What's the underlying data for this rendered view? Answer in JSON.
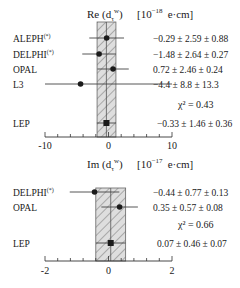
{
  "chart_data": [
    {
      "type": "scatter",
      "subtype": "forest-plot",
      "title": "Re (d_τ^w)",
      "title_parts": {
        "prefix": "Re (d",
        "sub": "τ",
        "sup": "w",
        "suffix": ")"
      },
      "unit": "[10^-18 e·cm]",
      "unit_parts": {
        "base": "[10",
        "exp": "−18",
        "tail": "e·cm]"
      },
      "xlim": [
        -10,
        10
      ],
      "xticks": [
        -10,
        0,
        10
      ],
      "xtick_labels": [
        "-10",
        "0",
        "10"
      ],
      "minor_ticks_between": 4,
      "grid": false,
      "band": {
        "center": -0.33,
        "low": -1.8,
        "high": 1.17,
        "style": "hatched"
      },
      "rows": [
        {
          "label": "ALEPH",
          "note": "(*)",
          "value": -0.29,
          "stat": 2.59,
          "syst": 0.88,
          "text": "−0.29 ± 2.59 ± 0.88",
          "marker": "circle"
        },
        {
          "label": "DELPHI",
          "note": "(*)",
          "value": -1.48,
          "stat": 2.64,
          "syst": 0.27,
          "text": "−1.48 ± 2.64 ± 0.27",
          "marker": "circle"
        },
        {
          "label": "OPAL",
          "note": "",
          "value": 0.72,
          "stat": 2.46,
          "syst": 0.24,
          "text": "0.72  ± 2.46 ± 0.24",
          "marker": "circle"
        },
        {
          "label": "L3",
          "note": "",
          "value": -4.4,
          "stat": 8.8,
          "syst": 13.3,
          "text": "−4.4  ± 8.8  ± 13.3",
          "marker": "circle"
        }
      ],
      "chi2": {
        "label": "χ² = 0.43",
        "value": 0.43
      },
      "combined": {
        "label": "LEP",
        "value": -0.33,
        "stat": 1.46,
        "syst": 0.36,
        "text": "−0.33 ± 1.46 ± 0.36",
        "marker": "square"
      }
    },
    {
      "type": "scatter",
      "subtype": "forest-plot",
      "title": "Im (d_τ^w)",
      "title_parts": {
        "prefix": "Im (d",
        "sub": "τ",
        "sup": "w",
        "suffix": ")"
      },
      "unit": "[10^-17 e·cm]",
      "unit_parts": {
        "base": "[10",
        "exp": "−17",
        "tail": "e·cm]"
      },
      "xlim": [
        -2,
        2
      ],
      "xticks": [
        -2,
        0,
        2
      ],
      "xtick_labels": [
        "-2",
        "0",
        "2"
      ],
      "minor_ticks_between": 4,
      "grid": false,
      "band": {
        "center": 0.07,
        "low": -0.4,
        "high": 0.54,
        "style": "hatched"
      },
      "rows": [
        {
          "label": "DELPHI",
          "note": "(*)",
          "value": -0.44,
          "stat": 0.77,
          "syst": 0.13,
          "text": "−0.44 ± 0.77 ± 0.13",
          "marker": "circle"
        },
        {
          "label": "OPAL",
          "note": "",
          "value": 0.35,
          "stat": 0.57,
          "syst": 0.08,
          "text": "0.35  ± 0.57 ± 0.08",
          "marker": "circle"
        }
      ],
      "chi2": {
        "label": "χ² = 0.66",
        "value": 0.66
      },
      "combined": {
        "label": "LEP",
        "value": 0.07,
        "stat": 0.46,
        "syst": 0.07,
        "text": "0.07 ± 0.46 ± 0.07",
        "marker": "square"
      }
    }
  ],
  "colors": {
    "ink": "#1a1a1a",
    "band_fill": "#d9d9d9",
    "hatch": "#9a9a9a",
    "line": "#555555"
  }
}
